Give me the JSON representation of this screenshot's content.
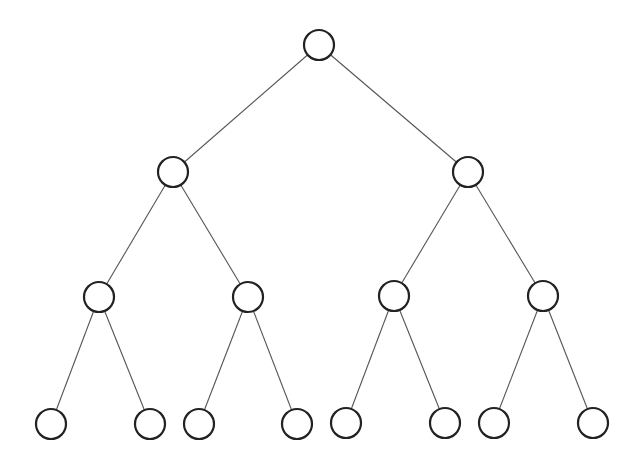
{
  "diagram": {
    "type": "binary-tree",
    "levels": 4,
    "node_radius": 15,
    "colors": {
      "edge": "#555555",
      "node_stroke": "#222222",
      "node_fill": "#ffffff",
      "background": "#ffffff"
    },
    "nodes": [
      {
        "id": "n0",
        "x": 319,
        "y": 45
      },
      {
        "id": "n1",
        "x": 173,
        "y": 172
      },
      {
        "id": "n2",
        "x": 468,
        "y": 172
      },
      {
        "id": "n3",
        "x": 99,
        "y": 297
      },
      {
        "id": "n4",
        "x": 248,
        "y": 297
      },
      {
        "id": "n5",
        "x": 394,
        "y": 296
      },
      {
        "id": "n6",
        "x": 543,
        "y": 296
      },
      {
        "id": "n7",
        "x": 51,
        "y": 424
      },
      {
        "id": "n8",
        "x": 150,
        "y": 424
      },
      {
        "id": "n9",
        "x": 199,
        "y": 424
      },
      {
        "id": "n10",
        "x": 297,
        "y": 424
      },
      {
        "id": "n11",
        "x": 346,
        "y": 423
      },
      {
        "id": "n12",
        "x": 445,
        "y": 423
      },
      {
        "id": "n13",
        "x": 494,
        "y": 423
      },
      {
        "id": "n14",
        "x": 593,
        "y": 423
      }
    ],
    "edges": [
      [
        "n0",
        "n1"
      ],
      [
        "n0",
        "n2"
      ],
      [
        "n1",
        "n3"
      ],
      [
        "n1",
        "n4"
      ],
      [
        "n2",
        "n5"
      ],
      [
        "n2",
        "n6"
      ],
      [
        "n3",
        "n7"
      ],
      [
        "n3",
        "n8"
      ],
      [
        "n4",
        "n9"
      ],
      [
        "n4",
        "n10"
      ],
      [
        "n5",
        "n11"
      ],
      [
        "n5",
        "n12"
      ],
      [
        "n6",
        "n13"
      ],
      [
        "n6",
        "n14"
      ]
    ]
  }
}
